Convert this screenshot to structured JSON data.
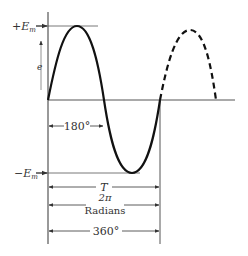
{
  "diagram": {
    "labels": {
      "pos_peak": "+E",
      "pos_peak_sub": "m",
      "neg_peak": "−E",
      "neg_peak_sub": "m",
      "y_axis": "e",
      "half_cycle": "180°",
      "period": "T",
      "radians_value": "2π",
      "radians_label": "Radians",
      "full_cycle": "360°"
    },
    "colors": {
      "curve": "#111111",
      "axis": "#555555",
      "text": "#333333"
    }
  }
}
